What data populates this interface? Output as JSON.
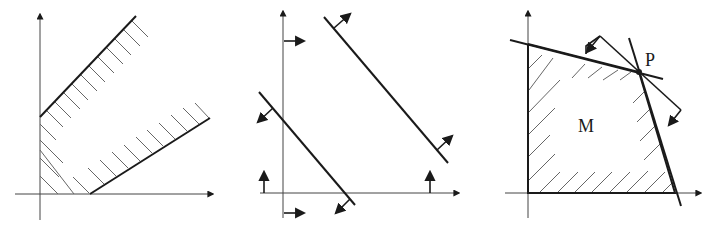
{
  "figure": {
    "panels": [
      {
        "id": "panel-1",
        "description": "Two parallel-ish boundary lines with hatched half-planes; unbounded feasible region",
        "labels": []
      },
      {
        "id": "panel-2",
        "description": "Two parallel lines with normal-direction arrows; axes with direction arrows",
        "labels": []
      },
      {
        "id": "panel-3",
        "description": "Bounded hatched polygon M with vertex P and two lines through P with arrows",
        "labels": [
          "M",
          "P"
        ]
      }
    ],
    "label_M": "M",
    "label_P": "P",
    "colors": {
      "line": "#1a1a1a",
      "hatch": "#555555",
      "background": "#ffffff"
    }
  }
}
